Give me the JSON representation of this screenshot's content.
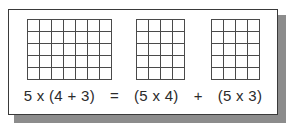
{
  "card": {
    "background_color": "#ffffff",
    "border_color": "#3a3a3a",
    "shadow_color": "#8c8c8c"
  },
  "diagram": {
    "grid_line_color": "#4a4a4a",
    "arrays": [
      {
        "name": "array-5x7",
        "rows": 5,
        "cols": 7,
        "total": 35,
        "label": "5 x 7"
      },
      {
        "name": "array-5x4",
        "rows": 5,
        "cols": 4,
        "total": 20,
        "label": "5 x 4"
      },
      {
        "name": "array-5x3",
        "rows": 5,
        "cols": 4,
        "total": 20,
        "label": "5 x 3"
      }
    ]
  },
  "equation": {
    "full_text": "5 x (4 + 3)  =  (5 x 4)  +  (5 x 3)",
    "left_term": "5 x (4 + 3)",
    "equals": "=",
    "first_product": "(5 x 4)",
    "plus": "+",
    "second_product": "(5 x 3)"
  }
}
